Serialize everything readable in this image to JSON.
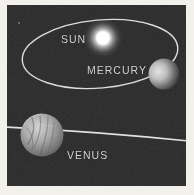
{
  "figure": {
    "labels": {
      "sun": "SUN",
      "mercury": "MERCURY",
      "venus": "VENUS"
    },
    "colors": {
      "page_background": "#f2f0ea",
      "panel": "#262626",
      "orbit_line": "#dcdcdc",
      "label_text": "#d4d4d4",
      "sun_core": "#ffffff",
      "mercury_lit": "#e0e0e0",
      "venus_light": "#cfcfcf",
      "venus_dark": "#3c3c3c"
    }
  }
}
